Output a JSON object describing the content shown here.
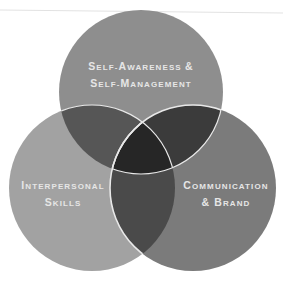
{
  "diagram": {
    "type": "venn",
    "background": "#ffffff",
    "sets": [
      {
        "id": "top",
        "label_lines": [
          {
            "parts": [
              {
                "text": "S",
                "size": "big"
              },
              {
                "text": "ELF-",
                "size": "small"
              },
              {
                "text": "A",
                "size": "big"
              },
              {
                "text": "WARENESS ",
                "size": "small"
              },
              {
                "text": "&",
                "size": "big"
              }
            ]
          },
          {
            "parts": [
              {
                "text": "S",
                "size": "big"
              },
              {
                "text": "ELF-",
                "size": "small"
              },
              {
                "text": "M",
                "size": "big"
              },
              {
                "text": "ANAGEMENT",
                "size": "small"
              }
            ]
          }
        ],
        "full_label": "Self-Awareness & Self-Management",
        "color": "#8e8e8e",
        "cx": 141,
        "cy": 92,
        "r": 82
      },
      {
        "id": "left",
        "label_lines": [
          {
            "parts": [
              {
                "text": "I",
                "size": "big"
              },
              {
                "text": "NTERPERSONAL",
                "size": "small"
              }
            ]
          },
          {
            "parts": [
              {
                "text": "S",
                "size": "big"
              },
              {
                "text": "KILLS",
                "size": "small"
              }
            ]
          }
        ],
        "full_label": "Interpersonal Skills",
        "color": "#a2a2a2",
        "cx": 92,
        "cy": 188,
        "r": 83
      },
      {
        "id": "right",
        "label_lines": [
          {
            "parts": [
              {
                "text": "C",
                "size": "big"
              },
              {
                "text": "OMMUNICATION",
                "size": "small"
              }
            ]
          },
          {
            "parts": [
              {
                "text": "& ",
                "size": "big"
              },
              {
                "text": "B",
                "size": "big"
              },
              {
                "text": "RAND",
                "size": "small"
              }
            ]
          }
        ],
        "full_label": "Communication & Brand",
        "color": "#7b7b7b",
        "cx": 193,
        "cy": 188,
        "r": 83
      }
    ],
    "overlap_colors": {
      "top_left": "#565656",
      "top_right": "#3b3b3b",
      "left_right": "#4a4a4a",
      "center": "#262626"
    },
    "outline_color": "#e8e8e8",
    "text_color": "#e6e6e6"
  }
}
